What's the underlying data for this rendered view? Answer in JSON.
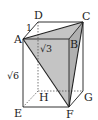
{
  "figure": {
    "type": "rectangular-prism",
    "vertices": {
      "A": "A",
      "B": "B",
      "C": "C",
      "D": "D",
      "E": "E",
      "F": "F",
      "G": "G",
      "H": "H"
    },
    "edge_labels": {
      "AD": "1",
      "AB": "√3",
      "AE": "√6"
    },
    "shaded_face": "ACF",
    "colors": {
      "line": "#333333",
      "shade": "#c4c4c4"
    }
  }
}
